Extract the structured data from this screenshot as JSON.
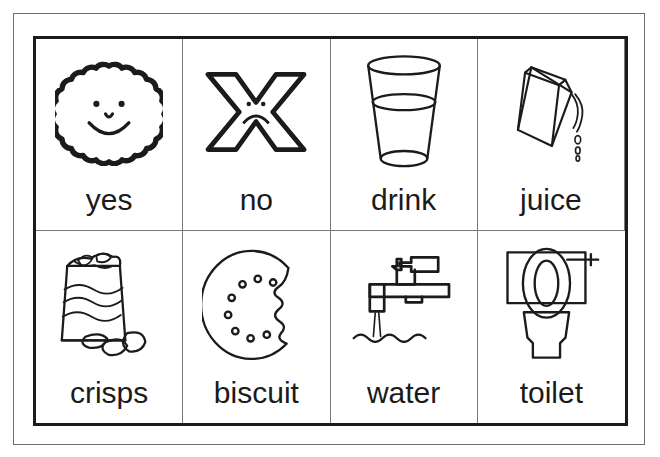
{
  "document": {
    "type": "communication-symbol-board",
    "columns": 4,
    "rows": 2,
    "ink_color": "#1b1b1b",
    "page_border_color": "#6e6e6e",
    "grid_line_color": "#7a7a7a",
    "background_color": "#ffffff"
  },
  "cells": [
    {
      "label": "yes",
      "icon": "scalloped-smiley-face-icon"
    },
    {
      "label": "no",
      "icon": "x-sad-face-icon"
    },
    {
      "label": "drink",
      "icon": "glass-of-drink-icon"
    },
    {
      "label": "juice",
      "icon": "pouring-juice-carton-icon"
    },
    {
      "label": "crisps",
      "icon": "crisps-packet-icon"
    },
    {
      "label": "biscuit",
      "icon": "bitten-biscuit-icon"
    },
    {
      "label": "water",
      "icon": "running-tap-icon"
    },
    {
      "label": "toilet",
      "icon": "toilet-icon"
    }
  ]
}
